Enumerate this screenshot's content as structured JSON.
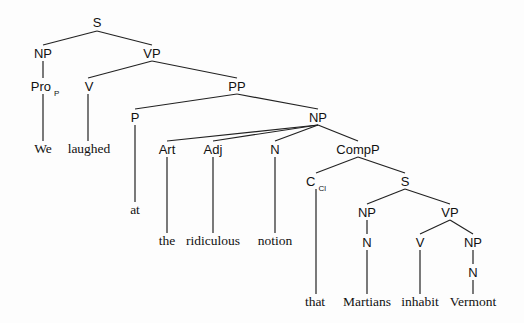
{
  "diagram": {
    "type": "syntax-tree",
    "sentence": "We laughed at the ridiculous notion that Martians inhabit Vermont",
    "nodes": [
      {
        "id": "s1",
        "label": "S",
        "sub": "",
        "kind": "cat",
        "x": 97,
        "y": 22
      },
      {
        "id": "np1",
        "label": "NP",
        "sub": "",
        "kind": "cat",
        "x": 43,
        "y": 53
      },
      {
        "id": "vp1",
        "label": "VP",
        "sub": "",
        "kind": "cat",
        "x": 152,
        "y": 53
      },
      {
        "id": "pro",
        "label": "Pro",
        "sub": "P",
        "kind": "cat",
        "x": 45,
        "y": 86
      },
      {
        "id": "v1",
        "label": "V",
        "sub": "",
        "kind": "cat",
        "x": 89,
        "y": 86
      },
      {
        "id": "pp",
        "label": "PP",
        "sub": "",
        "kind": "cat",
        "x": 237,
        "y": 86
      },
      {
        "id": "p",
        "label": "P",
        "sub": "",
        "kind": "cat",
        "x": 135,
        "y": 117
      },
      {
        "id": "np2",
        "label": "NP",
        "sub": "",
        "kind": "cat",
        "x": 318,
        "y": 117
      },
      {
        "id": "w_we",
        "label": "We",
        "sub": "",
        "kind": "word",
        "x": 43,
        "y": 149
      },
      {
        "id": "w_laughed",
        "label": "laughed",
        "sub": "",
        "kind": "word",
        "x": 89,
        "y": 149
      },
      {
        "id": "art",
        "label": "Art",
        "sub": "",
        "kind": "cat",
        "x": 167,
        "y": 149
      },
      {
        "id": "adj",
        "label": "Adj",
        "sub": "",
        "kind": "cat",
        "x": 213,
        "y": 149
      },
      {
        "id": "n1",
        "label": "N",
        "sub": "",
        "kind": "cat",
        "x": 275,
        "y": 149
      },
      {
        "id": "compp",
        "label": "CompP",
        "sub": "",
        "kind": "cat",
        "x": 358,
        "y": 149
      },
      {
        "id": "w_at",
        "label": "at",
        "sub": "",
        "kind": "word",
        "x": 135,
        "y": 210
      },
      {
        "id": "c",
        "label": "C",
        "sub": "Cl",
        "kind": "cat",
        "x": 316,
        "y": 181
      },
      {
        "id": "s2",
        "label": "S",
        "sub": "",
        "kind": "cat",
        "x": 405,
        "y": 181
      },
      {
        "id": "w_the",
        "label": "the",
        "sub": "",
        "kind": "word",
        "x": 167,
        "y": 241
      },
      {
        "id": "w_ridiculous",
        "label": "ridiculous",
        "sub": "",
        "kind": "word",
        "x": 213,
        "y": 241
      },
      {
        "id": "w_notion",
        "label": "notion",
        "sub": "",
        "kind": "word",
        "x": 275,
        "y": 241
      },
      {
        "id": "np3",
        "label": "NP",
        "sub": "",
        "kind": "cat",
        "x": 367,
        "y": 212
      },
      {
        "id": "vp2",
        "label": "VP",
        "sub": "",
        "kind": "cat",
        "x": 450,
        "y": 212
      },
      {
        "id": "n2",
        "label": "N",
        "sub": "",
        "kind": "cat",
        "x": 367,
        "y": 242
      },
      {
        "id": "v2",
        "label": "V",
        "sub": "",
        "kind": "cat",
        "x": 420,
        "y": 242
      },
      {
        "id": "np4",
        "label": "NP",
        "sub": "",
        "kind": "cat",
        "x": 473,
        "y": 242
      },
      {
        "id": "n3",
        "label": "N",
        "sub": "",
        "kind": "cat",
        "x": 473,
        "y": 272
      },
      {
        "id": "w_that",
        "label": "that",
        "sub": "",
        "kind": "word",
        "x": 315,
        "y": 302
      },
      {
        "id": "w_martians",
        "label": "Martians",
        "sub": "",
        "kind": "word",
        "x": 367,
        "y": 302
      },
      {
        "id": "w_inhabit",
        "label": "inhabit",
        "sub": "",
        "kind": "word",
        "x": 420,
        "y": 302
      },
      {
        "id": "w_vermont",
        "label": "Vermont",
        "sub": "",
        "kind": "word",
        "x": 473,
        "y": 302
      }
    ],
    "edges": [
      [
        97,
        31,
        43,
        45
      ],
      [
        97,
        31,
        152,
        45
      ],
      [
        43,
        61,
        43,
        78
      ],
      [
        152,
        61,
        88,
        78
      ],
      [
        152,
        61,
        237,
        78
      ],
      [
        43,
        94,
        43,
        141
      ],
      [
        88,
        94,
        88,
        141
      ],
      [
        237,
        94,
        135,
        109
      ],
      [
        237,
        94,
        318,
        109
      ],
      [
        135,
        125,
        135,
        202
      ],
      [
        318,
        125,
        167,
        141
      ],
      [
        318,
        125,
        213,
        141
      ],
      [
        318,
        125,
        275,
        141
      ],
      [
        318,
        125,
        358,
        141
      ],
      [
        167,
        157,
        167,
        233
      ],
      [
        213,
        157,
        213,
        233
      ],
      [
        275,
        157,
        275,
        233
      ],
      [
        358,
        157,
        316,
        173
      ],
      [
        358,
        157,
        405,
        173
      ],
      [
        316,
        189,
        316,
        294
      ],
      [
        405,
        189,
        367,
        204
      ],
      [
        405,
        189,
        450,
        204
      ],
      [
        367,
        220,
        367,
        234
      ],
      [
        450,
        220,
        420,
        234
      ],
      [
        450,
        220,
        473,
        234
      ],
      [
        367,
        250,
        367,
        294
      ],
      [
        420,
        250,
        420,
        294
      ],
      [
        473,
        250,
        473,
        264
      ],
      [
        473,
        280,
        473,
        294
      ]
    ]
  }
}
